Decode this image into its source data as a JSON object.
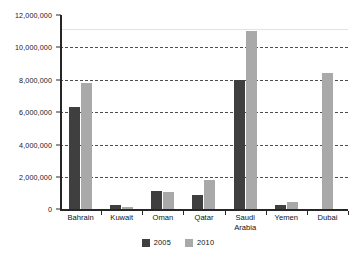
{
  "chart_data": {
    "type": "bar",
    "title": "",
    "subtitle": "",
    "xlabel": "",
    "ylabel": "",
    "ylim": [
      0,
      12000000
    ],
    "ytick_step": 2000000,
    "grid": true,
    "grid_style": "dashed horizontal",
    "legend_position": "bottom-center",
    "categories": [
      "Bahrain",
      "Kuwait",
      "Oman",
      "Qatar",
      "Saudi\nArabia",
      "Yemen",
      "Dubai"
    ],
    "category_labels_flat": [
      "Bahrain",
      "Kuwait",
      "Oman",
      "Qatar",
      "Saudi Arabia",
      "Yemen",
      "Dubai"
    ],
    "ytick_labels": [
      "12,000,000",
      "10,000,000",
      "8,000,000",
      "6,000,000",
      "4,000,000",
      "2,000,000",
      "0"
    ],
    "ytick_values": [
      12000000,
      10000000,
      8000000,
      6000000,
      4000000,
      2000000,
      0
    ],
    "series": [
      {
        "name": "2005",
        "color": "#3f3f3f",
        "values": [
          6300000,
          250000,
          1150000,
          900000,
          8000000,
          300000,
          null
        ]
      },
      {
        "name": "2010",
        "color": "#a9a9a9",
        "values": [
          7800000,
          180000,
          1050000,
          1800000,
          11000000,
          450000,
          8400000
        ]
      }
    ]
  },
  "legend": {
    "entries": [
      {
        "label": "2005",
        "color": "#3f3f3f"
      },
      {
        "label": "2010",
        "color": "#a9a9a9"
      }
    ]
  }
}
